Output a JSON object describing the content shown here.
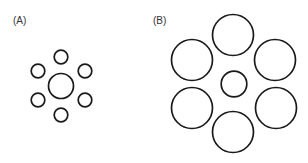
{
  "figure": {
    "panels": [
      {
        "label": "(A)",
        "label_pos": [
          13,
          16
        ],
        "center_circle": {
          "cx": 61,
          "cy": 86,
          "r": 12.5
        },
        "surround_circles": [
          {
            "cx": 61,
            "cy": 57,
            "r": 6.8
          },
          {
            "cx": 85,
            "cy": 71,
            "r": 6.8
          },
          {
            "cx": 85,
            "cy": 100,
            "r": 6.8
          },
          {
            "cx": 61,
            "cy": 115,
            "r": 6.8
          },
          {
            "cx": 38,
            "cy": 100,
            "r": 6.8
          },
          {
            "cx": 38,
            "cy": 71,
            "r": 6.8
          }
        ]
      },
      {
        "label": "(B)",
        "label_pos": [
          153,
          16
        ],
        "center_circle": {
          "cx": 234,
          "cy": 84,
          "r": 12.8
        },
        "surround_circles": [
          {
            "cx": 233,
            "cy": 35,
            "r": 20.5
          },
          {
            "cx": 275,
            "cy": 60,
            "r": 20.5
          },
          {
            "cx": 276,
            "cy": 108,
            "r": 20.5
          },
          {
            "cx": 233,
            "cy": 132,
            "r": 20.5
          },
          {
            "cx": 192,
            "cy": 108,
            "r": 20.5
          },
          {
            "cx": 192,
            "cy": 60,
            "r": 20.5
          }
        ]
      }
    ],
    "stroke_color": "#1a1a1a",
    "stroke_width": 1.7
  }
}
